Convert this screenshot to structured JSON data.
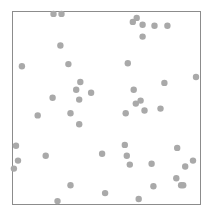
{
  "chart_data": {
    "type": "scatter",
    "title": "",
    "xlabel": "",
    "ylabel": "",
    "xlim": [
      0,
      1
    ],
    "ylim": [
      0,
      1
    ],
    "grid": false,
    "legend": null,
    "frame": true,
    "colors": {
      "point": "#a9a9a9",
      "frame": "#8c8c8c",
      "background": "#ffffff"
    },
    "point_radius": 3.2,
    "series": [
      {
        "name": "points",
        "points": [
          [
            0.218,
            0.995
          ],
          [
            0.261,
            0.995
          ],
          [
            0.644,
            0.953
          ],
          [
            0.665,
            0.974
          ],
          [
            0.697,
            0.938
          ],
          [
            0.761,
            0.933
          ],
          [
            0.83,
            0.933
          ],
          [
            0.697,
            0.876
          ],
          [
            0.255,
            0.829
          ],
          [
            0.048,
            0.72
          ],
          [
            0.298,
            0.731
          ],
          [
            0.617,
            0.736
          ],
          [
            0.362,
            0.637
          ],
          [
            0.814,
            0.632
          ],
          [
            0.984,
            0.663
          ],
          [
            0.34,
            0.596
          ],
          [
            0.649,
            0.596
          ],
          [
            0.42,
            0.58
          ],
          [
            0.213,
            0.554
          ],
          [
            0.356,
            0.544
          ],
          [
            0.66,
            0.523
          ],
          [
            0.686,
            0.539
          ],
          [
            0.707,
            0.487
          ],
          [
            0.606,
            0.472
          ],
          [
            0.793,
            0.497
          ],
          [
            0.133,
            0.461
          ],
          [
            0.309,
            0.472
          ],
          [
            0.356,
            0.415
          ],
          [
            0.016,
            0.301
          ],
          [
            0.601,
            0.306
          ],
          [
            0.883,
            0.29
          ],
          [
            0.479,
            0.259
          ],
          [
            0.176,
            0.249
          ],
          [
            0.612,
            0.249
          ],
          [
            0.027,
            0.223
          ],
          [
            0.968,
            0.223
          ],
          [
            0.926,
            0.192
          ],
          [
            0.628,
            0.202
          ],
          [
            0.745,
            0.207
          ],
          [
            0.005,
            0.181
          ],
          [
            0.309,
            0.093
          ],
          [
            0.878,
            0.13
          ],
          [
            0.755,
            0.088
          ],
          [
            0.904,
            0.093
          ],
          [
            0.915,
            0.093
          ],
          [
            0.495,
            0.052
          ],
          [
            0.239,
            0.01
          ],
          [
            0.676,
            0.021
          ]
        ]
      }
    ]
  }
}
